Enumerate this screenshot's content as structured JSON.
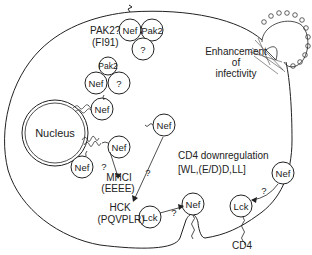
{
  "diagram": {
    "type": "biological-schematic",
    "nodes": {
      "nucleus": "Nucleus",
      "nef": "Nef",
      "pak2": "Pak2",
      "unknown": "?",
      "lck": "Lck"
    },
    "labels": {
      "pak2_question": "PAK2?",
      "pak2_motif": "(FI91)",
      "enhancement_line1": "Enhancement",
      "enhancement_line2": "of",
      "enhancement_line3": "infectivity",
      "mhc": "MHCI",
      "mhc_motif": "(EEEE)",
      "hck": "HCK",
      "hck_motif": "(PQVPLR)",
      "cd4_down": "CD4 downregulation",
      "cd4_motif": "[WL,(E/D)D,LL]",
      "cd4": "CD4",
      "q": "?"
    },
    "colors": {
      "stroke": "#222222",
      "background": "#ffffff"
    }
  }
}
